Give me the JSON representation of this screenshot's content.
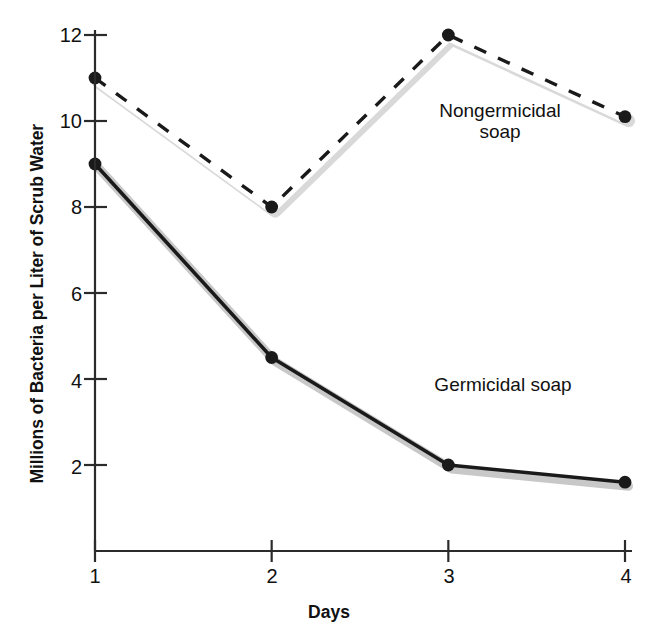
{
  "chart_data": {
    "type": "line",
    "title": "",
    "xlabel": "Days",
    "ylabel": "Millions of Bacteria per Liter of Scrub Water",
    "x": [
      1,
      2,
      3,
      4
    ],
    "xtick_labels": [
      "1",
      "2",
      "3",
      "4"
    ],
    "ytick_labels": [
      "2",
      "4",
      "6",
      "8",
      "10",
      "12"
    ],
    "ytick_values": [
      2,
      4,
      6,
      8,
      10,
      12
    ],
    "xlim": [
      1,
      4
    ],
    "ylim": [
      0,
      12
    ],
    "grid": false,
    "legend_position": "inline-annotations",
    "series": [
      {
        "name": "Nongermicidal soap",
        "values": [
          11.0,
          8.0,
          12.0,
          10.1
        ],
        "style": "dashed",
        "marker": "filled-circle",
        "color": "#1a1a1a",
        "halo_color": "#d9d9d9"
      },
      {
        "name": "Germicidal soap",
        "values": [
          9.0,
          4.5,
          2.0,
          1.6
        ],
        "style": "solid",
        "marker": "filled-circle",
        "color": "#1a1a1a",
        "halo_color": "#c8c8c8"
      }
    ],
    "annotations": [
      {
        "text": "Nongermicidal\nsoap",
        "series": "Nongermicidal soap"
      },
      {
        "text": "Germicidal soap",
        "series": "Germicidal soap"
      }
    ]
  },
  "axis": {
    "y_title": "Millions of Bacteria per Liter of Scrub Water",
    "x_title": "Days",
    "y_ticks": [
      "12",
      "10",
      "8",
      "6",
      "4",
      "2"
    ],
    "x_ticks": [
      "1",
      "2",
      "3",
      "4"
    ]
  },
  "labels": {
    "nongermicidal": "Nongermicidal\nsoap",
    "germicidal": "Germicidal soap"
  },
  "colors": {
    "ink": "#1a1a1a",
    "axis": "#2b2b2b",
    "shadow": "#d5d5d5",
    "line_core": "#ffffff",
    "background": "#ffffff"
  }
}
